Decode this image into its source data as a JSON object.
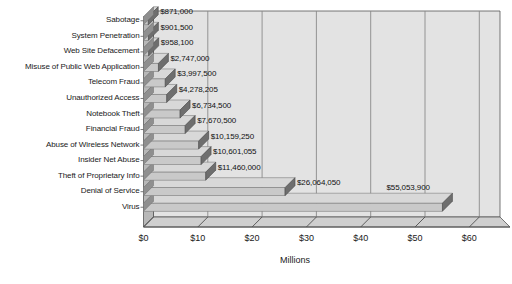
{
  "chart_data": {
    "type": "bar",
    "orientation": "horizontal",
    "title": "",
    "xlabel": "Millions",
    "ylabel": "",
    "xlim": [
      0,
      62
    ],
    "xunit": "millions_usd",
    "grid": true,
    "legend": false,
    "style": "3d-horizontal-bar",
    "xticks": [
      "$0",
      "$10",
      "$20",
      "$30",
      "$40",
      "$50",
      "$60"
    ],
    "xtickvalues": [
      0,
      10,
      20,
      30,
      40,
      50,
      60
    ],
    "categories": [
      "Sabotage",
      "System Penetration",
      "Web Site Defacement",
      "Misuse of Public Web Application",
      "Telecom Fraud",
      "Unauthorized Access",
      "Notebook Theft",
      "Financial Fraud",
      "Abuse of Wireless Network",
      "Insider Net Abuse",
      "Theft of Proprietary Info",
      "Denial of Service",
      "Virus"
    ],
    "values": [
      871000,
      901500,
      958100,
      2747000,
      3997500,
      4278205,
      6734500,
      7670500,
      10159250,
      10601055,
      11460000,
      26064050,
      55053900
    ],
    "value_labels": [
      "$871,000",
      "$901,500",
      "$958,100",
      "$2,747,000",
      "$3,997,500",
      "$4,278,205",
      "$6,734,500",
      "$7,670,500",
      "$10,159,250",
      "$10,601,055",
      "$11,460,000",
      "$26,064,050",
      "$55,053,900"
    ]
  },
  "colors": {
    "bar_top": "#d8d8d8",
    "bar_front": "#c9c9c9",
    "bar_cap": "#6e6e6e",
    "plot_background": "#e3e3e3",
    "wall_side": "#b8b8b8",
    "floor": "#cfcfcf",
    "gridline": "#8a8a8a",
    "axis_line": "#555555",
    "text": "#1a1a1a"
  }
}
